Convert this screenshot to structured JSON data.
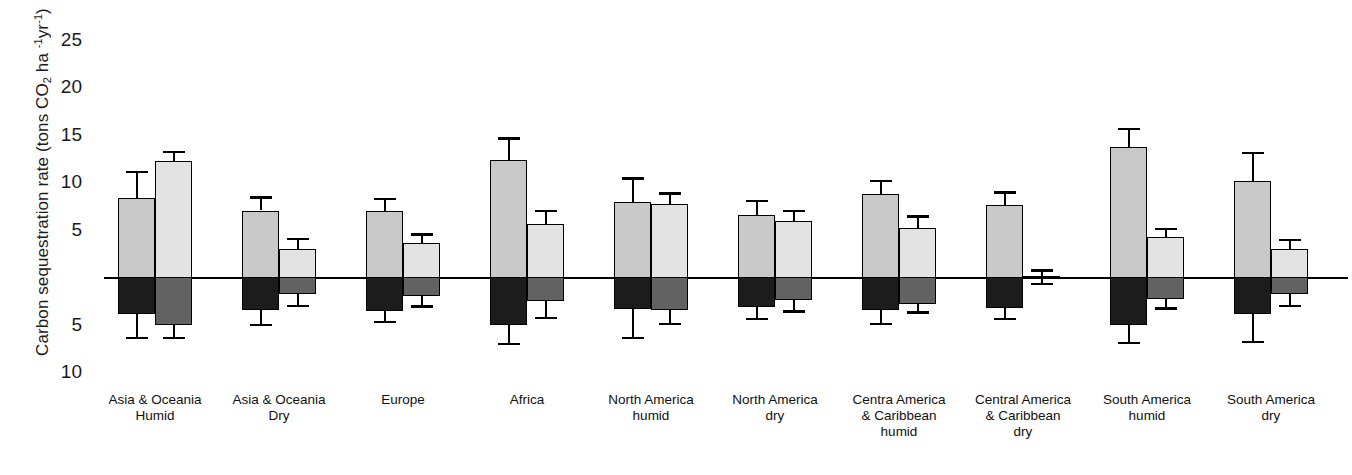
{
  "chart_data": {
    "type": "bar",
    "title": "",
    "xlabel": "",
    "ylabel": "Carbon sequestration rate (tons CO2 ha -1yr-1)",
    "ylabel_parts": {
      "lead": "Carbon sequestration rate (tons CO",
      "sub2": "2",
      "mid": " ha ",
      "sup1": "-1",
      "unit": "yr",
      "sup2": "-1",
      "tail": ")"
    },
    "ylim": [
      -12,
      26
    ],
    "grid": false,
    "legend": "none",
    "zero_line": 0,
    "ytick_labels": [
      "25",
      "20",
      "15",
      "10",
      "5",
      "5",
      "10"
    ],
    "ytick_values": [
      25,
      20,
      15,
      10,
      5,
      -5,
      -10
    ],
    "categories": [
      "Asia & Oceania Humid",
      "Asia & Oceania Dry",
      "Europe",
      "Africa",
      "North America humid",
      "North America dry",
      "Centra America & Caribbean humid",
      "Central America & Caribbean dry",
      "South America humid",
      "South America dry"
    ],
    "category_lines": [
      [
        "Asia & Oceania",
        "Humid"
      ],
      [
        "Asia & Oceania",
        "Dry"
      ],
      [
        "Europe"
      ],
      [
        "Africa"
      ],
      [
        "North America",
        "humid"
      ],
      [
        "North America",
        "dry"
      ],
      [
        "Centra America",
        "& Caribbean",
        "humid"
      ],
      [
        "Central America",
        "& Caribbean",
        "dry"
      ],
      [
        "South America",
        "humid"
      ],
      [
        "South America",
        "dry"
      ]
    ],
    "series": [
      {
        "name": "series-1",
        "positive_values": [
          8.3,
          7.0,
          6.9,
          12.3,
          7.9,
          6.5,
          8.7,
          7.6,
          13.7,
          10.1
        ],
        "positive_err_high": [
          11.1,
          8.4,
          8.2,
          14.6,
          10.4,
          8.0,
          10.1,
          8.9,
          15.6,
          13.1
        ],
        "negative_values": [
          -3.9,
          -3.5,
          -3.6,
          -5.0,
          -3.4,
          -3.2,
          -3.5,
          -3.3,
          -5.0,
          -3.9
        ],
        "negative_err_low": [
          -6.4,
          -5.0,
          -4.7,
          -7.0,
          -6.4,
          -4.4,
          -4.9,
          -4.4,
          -6.9,
          -6.8
        ],
        "fill_positive": "#c9c9c9",
        "fill_negative": "#1c1c1c"
      },
      {
        "name": "series-2",
        "positive_values": [
          12.2,
          3.0,
          3.6,
          5.6,
          7.7,
          5.9,
          5.2,
          0.15,
          4.2,
          2.9
        ],
        "positive_err_high": [
          13.2,
          4.0,
          4.5,
          7.0,
          8.8,
          7.0,
          6.4,
          0.7,
          5.1,
          3.9
        ],
        "negative_values": [
          -5.0,
          -1.8,
          -2.0,
          -2.5,
          -3.5,
          -2.4,
          -2.8,
          -0.15,
          -2.3,
          -1.8
        ],
        "negative_err_low": [
          -6.4,
          -3.0,
          -3.1,
          -4.3,
          -4.9,
          -3.6,
          -3.7,
          -0.7,
          -3.3,
          -3.0
        ],
        "fill_positive": "#e3e3e3",
        "fill_negative": "#626262"
      }
    ],
    "colors": {
      "axis": "#000000",
      "text": "#1b1b1b",
      "background": "#ffffff"
    }
  }
}
